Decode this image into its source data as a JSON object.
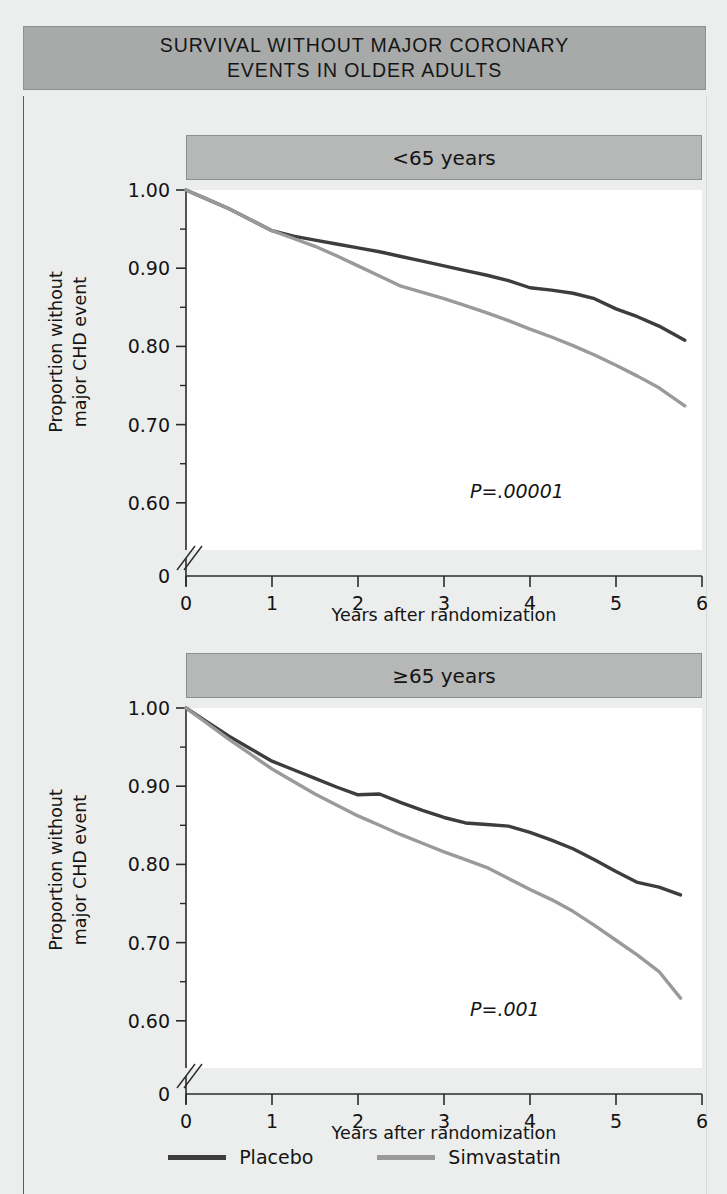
{
  "figure": {
    "title_lines": [
      "SURVIVAL WITHOUT MAJOR CORONARY",
      "EVENTS IN OLDER ADULTS"
    ],
    "banner_color": "#a8aaa9"
  },
  "legend": {
    "position": "bottom-center",
    "entries": [
      {
        "label": "Placebo",
        "color": "#3d3d3d"
      },
      {
        "label": "Simvastatin",
        "color": "#9a9a9a"
      }
    ]
  },
  "chart_data": [
    {
      "type": "line",
      "title": "<65 years",
      "xlabel": "Years after randomization",
      "ylabel": "Proportion without major CHD event",
      "ylabel_lines": [
        "Proportion without",
        "major CHD event"
      ],
      "annotation": "P=.00001",
      "xlim": [
        0,
        6
      ],
      "ylim": [
        0.555,
        1.0
      ],
      "axis_break": true,
      "grid": false,
      "xticks": [
        0,
        1,
        2,
        3,
        4,
        5,
        6
      ],
      "xtick_labels": [
        "0",
        "1",
        "2",
        "3",
        "4",
        "5",
        "6"
      ],
      "yticks": [
        1.0,
        0.9,
        0.8,
        0.7,
        0.6
      ],
      "ytick_labels": [
        "1.00",
        "0.90",
        "0.80",
        "0.70",
        "0.60"
      ],
      "y_zero_label": "0",
      "yticks_minor": [
        0.95,
        0.85,
        0.75,
        0.65
      ],
      "series": [
        {
          "name": "Placebo",
          "color": "#3d3d3d",
          "x": [
            0,
            0.25,
            0.5,
            0.75,
            1.0,
            1.25,
            1.5,
            1.75,
            2.0,
            2.25,
            2.5,
            2.75,
            3.0,
            3.25,
            3.5,
            3.75,
            4.0,
            4.25,
            4.5,
            4.75,
            5.0,
            5.25,
            5.5,
            5.8
          ],
          "y": [
            1.0,
            0.988,
            0.976,
            0.962,
            0.948,
            0.941,
            0.936,
            0.931,
            0.926,
            0.921,
            0.915,
            0.909,
            0.903,
            0.897,
            0.891,
            0.884,
            0.875,
            0.872,
            0.868,
            0.861,
            0.848,
            0.838,
            0.826,
            0.808
          ]
        },
        {
          "name": "Simvastatin",
          "color": "#9a9a9a",
          "x": [
            0,
            0.25,
            0.5,
            0.75,
            1.0,
            1.25,
            1.5,
            1.75,
            2.0,
            2.25,
            2.5,
            2.75,
            3.0,
            3.25,
            3.5,
            3.75,
            4.0,
            4.25,
            4.5,
            4.75,
            5.0,
            5.25,
            5.5,
            5.8
          ],
          "y": [
            1.0,
            0.988,
            0.976,
            0.962,
            0.948,
            0.938,
            0.928,
            0.916,
            0.903,
            0.89,
            0.877,
            0.869,
            0.861,
            0.852,
            0.843,
            0.833,
            0.822,
            0.812,
            0.801,
            0.789,
            0.776,
            0.762,
            0.747,
            0.724
          ]
        }
      ]
    },
    {
      "type": "line",
      "title": "≥65 years",
      "xlabel": "Years after randomization",
      "ylabel": "Proportion without major CHD event",
      "ylabel_lines": [
        "Proportion without",
        "major CHD event"
      ],
      "annotation": "P=.001",
      "xlim": [
        0,
        6
      ],
      "ylim": [
        0.555,
        1.0
      ],
      "axis_break": true,
      "grid": false,
      "xticks": [
        0,
        1,
        2,
        3,
        4,
        5,
        6
      ],
      "xtick_labels": [
        "0",
        "1",
        "2",
        "3",
        "4",
        "5",
        "6"
      ],
      "yticks": [
        1.0,
        0.9,
        0.8,
        0.7,
        0.6
      ],
      "ytick_labels": [
        "1.00",
        "0.90",
        "0.80",
        "0.70",
        "0.60"
      ],
      "y_zero_label": "0",
      "yticks_minor": [
        0.95,
        0.85,
        0.75,
        0.65
      ],
      "series": [
        {
          "name": "Placebo",
          "color": "#3d3d3d",
          "x": [
            0,
            0.25,
            0.5,
            0.75,
            1.0,
            1.25,
            1.5,
            1.75,
            2.0,
            2.25,
            2.5,
            2.75,
            3.0,
            3.25,
            3.5,
            3.75,
            4.0,
            4.25,
            4.5,
            4.75,
            5.0,
            5.25,
            5.5,
            5.75
          ],
          "y": [
            1.0,
            0.982,
            0.964,
            0.948,
            0.932,
            0.921,
            0.91,
            0.899,
            0.889,
            0.89,
            0.879,
            0.869,
            0.86,
            0.853,
            0.851,
            0.849,
            0.841,
            0.831,
            0.82,
            0.806,
            0.791,
            0.777,
            0.771,
            0.761
          ]
        },
        {
          "name": "Simvastatin",
          "color": "#9a9a9a",
          "x": [
            0,
            0.25,
            0.5,
            0.75,
            1.0,
            1.25,
            1.5,
            1.75,
            2.0,
            2.25,
            2.5,
            2.75,
            3.0,
            3.25,
            3.5,
            3.75,
            4.0,
            4.25,
            4.5,
            4.75,
            5.0,
            5.25,
            5.5,
            5.75
          ],
          "y": [
            1.0,
            0.98,
            0.96,
            0.941,
            0.922,
            0.906,
            0.89,
            0.876,
            0.862,
            0.85,
            0.838,
            0.827,
            0.816,
            0.806,
            0.796,
            0.782,
            0.768,
            0.755,
            0.74,
            0.722,
            0.703,
            0.684,
            0.663,
            0.629
          ]
        }
      ]
    }
  ]
}
